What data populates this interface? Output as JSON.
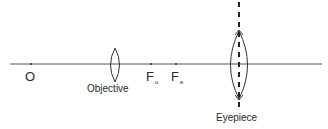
{
  "diagram": {
    "type": "compound-microscope-ray-setup",
    "principal_axis": {
      "y": 64,
      "x_start": 10,
      "x_end": 322
    },
    "points": [
      {
        "id": "O",
        "label": "O",
        "subscript": "",
        "x": 31
      },
      {
        "id": "Fo",
        "label": "F",
        "subscript": "o",
        "x": 151
      },
      {
        "id": "Fe",
        "label": "F",
        "subscript": "e",
        "x": 176
      }
    ],
    "lenses": [
      {
        "id": "objective",
        "label": "Objective",
        "cx": 115,
        "top": 48,
        "bottom": 82,
        "half_width": 6
      },
      {
        "id": "eyepiece",
        "label": "Eyepiece",
        "cx": 239,
        "top": 31,
        "bottom": 99,
        "half_width": 10,
        "dashed_axis": true
      }
    ],
    "colors": {
      "line": "#333333",
      "axis": "#555555"
    }
  },
  "labels": {
    "O": "O",
    "F": "F",
    "o_sub": "o",
    "e_sub": "e",
    "objective": "Objective",
    "eyepiece": "Eyepiece"
  }
}
